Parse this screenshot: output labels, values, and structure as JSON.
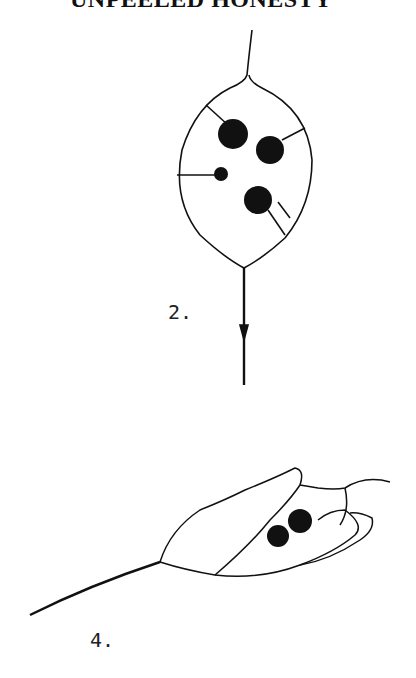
{
  "page": {
    "title": "UNPEELED HONESTY",
    "figures": [
      {
        "label": "2.",
        "description": "Honesty seed pod (Lunaria) with seeds visible through membrane"
      },
      {
        "label": "4.",
        "description": "Unpeeled honesty pod viewed from the side, outer valve partly lifted"
      }
    ]
  },
  "colors": {
    "ink": "#111111",
    "background": "#ffffff"
  }
}
